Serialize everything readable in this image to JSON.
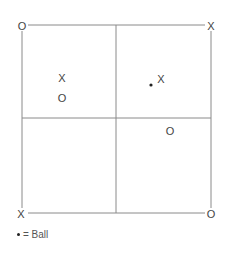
{
  "diagram": {
    "grid_color": "#8a8a8a",
    "mark_color": "#444444",
    "corners": {
      "top_left": "O",
      "top_right": "X",
      "bottom_left": "X",
      "bottom_right": "O"
    },
    "quadrant_marks": [
      {
        "quadrant": "top-left",
        "label": "X",
        "x": 62,
        "y": 78
      },
      {
        "quadrant": "top-left",
        "label": "O",
        "x": 62,
        "y": 98
      },
      {
        "quadrant": "top-right",
        "label": "X",
        "x": 161,
        "y": 79
      },
      {
        "quadrant": "bottom-right",
        "label": "O",
        "x": 170,
        "y": 131
      }
    ],
    "ball": {
      "quadrant": "top-right",
      "x": 151,
      "y": 85
    }
  },
  "legend": {
    "symbol": "•",
    "text": "= Ball"
  }
}
